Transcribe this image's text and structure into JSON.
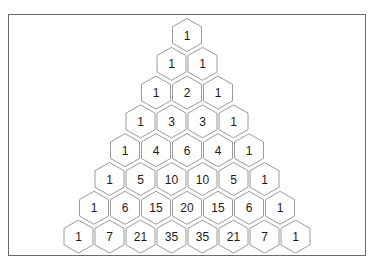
{
  "diagram": {
    "shape": "hexagon",
    "rows": [
      [
        1
      ],
      [
        1,
        1
      ],
      [
        1,
        2,
        1
      ],
      [
        1,
        3,
        3,
        1
      ],
      [
        1,
        4,
        6,
        4,
        1
      ],
      [
        1,
        5,
        10,
        10,
        5,
        1
      ],
      [
        1,
        6,
        15,
        20,
        15,
        6,
        1
      ],
      [
        1,
        7,
        21,
        35,
        35,
        21,
        7,
        1
      ]
    ],
    "colors": {
      "hex_stroke": "#9a9a9a",
      "hex_fill": "#ffffff",
      "text": "#1a1a1a",
      "frame_border": "#6a6a6a"
    }
  }
}
